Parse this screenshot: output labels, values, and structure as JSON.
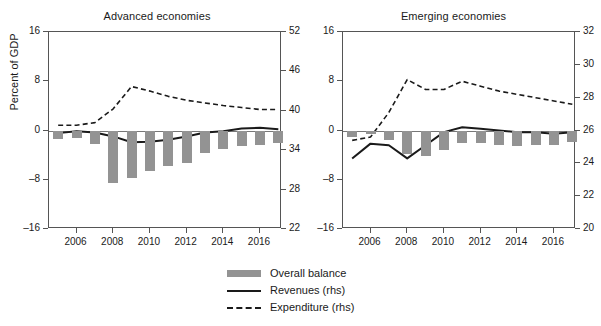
{
  "figure": {
    "ylabel_left": "Percent of GDP",
    "legend": [
      {
        "key": "bar",
        "label": "Overall balance"
      },
      {
        "key": "solid",
        "label": "Revenues (rhs)"
      },
      {
        "key": "dashed",
        "label": "Expenditure (rhs)"
      }
    ],
    "colors": {
      "bar": "#939393",
      "line": "#1a1a1a",
      "axis": "#555555",
      "background": "#ffffff"
    }
  },
  "chart_data": [
    {
      "type": "bar",
      "title": "Advanced economies",
      "xlabel": "",
      "ylabel": "Percent of GDP",
      "x": [
        2005,
        2006,
        2007,
        2008,
        2009,
        2010,
        2011,
        2012,
        2013,
        2014,
        2015,
        2016,
        2017
      ],
      "xticks": [
        2006,
        2008,
        2010,
        2012,
        2014,
        2016
      ],
      "xlim": [
        2004.5,
        2017.2
      ],
      "ylim": [
        -16,
        16
      ],
      "yticks": [
        -16,
        -8,
        0,
        8,
        16
      ],
      "ylim_right": [
        22,
        52
      ],
      "yticks_right": [
        22,
        28,
        34,
        40,
        46,
        52
      ],
      "ylabel_right": "",
      "grid": false,
      "legend_position": "below-figure",
      "series": [
        {
          "name": "Overall balance",
          "type": "bar",
          "axis": "left",
          "values": [
            -1.3,
            -1.2,
            -2.2,
            -8.6,
            -7.7,
            -6.5,
            -5.7,
            -5.3,
            -3.6,
            -3.0,
            -2.5,
            -2.3,
            -2.0
          ]
        },
        {
          "name": "Revenues (rhs)",
          "type": "line",
          "axis": "right",
          "values": [
            36.6,
            36.9,
            36.7,
            36.1,
            35.2,
            35.3,
            35.6,
            36.1,
            36.7,
            36.9,
            37.3,
            37.4,
            37.2
          ]
        },
        {
          "name": "Expenditure (rhs)",
          "type": "line",
          "axis": "right",
          "values": [
            37.8,
            37.8,
            38.2,
            40.3,
            43.7,
            43.0,
            42.2,
            41.6,
            41.2,
            40.8,
            40.5,
            40.2,
            40.2
          ]
        }
      ]
    },
    {
      "type": "bar",
      "title": "Emerging economies",
      "xlabel": "",
      "ylabel": "",
      "x": [
        2005,
        2006,
        2007,
        2008,
        2009,
        2010,
        2011,
        2012,
        2013,
        2014,
        2015,
        2016,
        2017
      ],
      "xticks": [
        2006,
        2008,
        2010,
        2012,
        2014,
        2016
      ],
      "xlim": [
        2004.5,
        2017.2
      ],
      "ylim": [
        -16,
        16
      ],
      "yticks": [
        -16,
        -8,
        0,
        8,
        16
      ],
      "ylim_right": [
        20,
        32
      ],
      "yticks_right": [
        20,
        22,
        24,
        26,
        28,
        30,
        32
      ],
      "ylabel_right": "",
      "grid": false,
      "legend_position": "below-figure",
      "series": [
        {
          "name": "Overall balance",
          "type": "bar",
          "axis": "left",
          "values": [
            -1.1,
            -0.6,
            -1.6,
            -3.8,
            -4.2,
            -3.1,
            -2.0,
            -2.1,
            -2.3,
            -2.5,
            -2.4,
            -2.3,
            -1.9
          ]
        },
        {
          "name": "Revenues (rhs)",
          "type": "line",
          "axis": "right",
          "values": [
            24.3,
            25.2,
            25.1,
            24.3,
            25.1,
            25.9,
            26.2,
            26.1,
            26.0,
            25.9,
            25.9,
            25.8,
            25.9
          ]
        },
        {
          "name": "Expenditure (rhs)",
          "type": "line",
          "axis": "right",
          "values": [
            25.4,
            25.6,
            27.1,
            29.1,
            28.5,
            28.5,
            29.0,
            28.7,
            28.4,
            28.2,
            28.0,
            27.8,
            27.6
          ]
        }
      ]
    }
  ]
}
